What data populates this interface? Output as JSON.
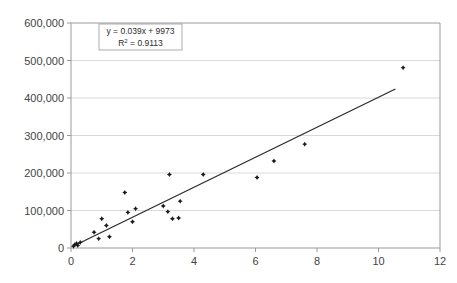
{
  "chart_data": {
    "type": "scatter",
    "title": "",
    "xlabel": "",
    "ylabel": "",
    "xlim": [
      0,
      12
    ],
    "ylim": [
      0,
      600000
    ],
    "grid": true,
    "legend": "none",
    "x_ticks": [
      "0",
      "2",
      "4",
      "6",
      "8",
      "10",
      "12"
    ],
    "x_tick_values": [
      0,
      2,
      4,
      6,
      8,
      10,
      12
    ],
    "y_ticks": [
      "0",
      "100,000",
      "200,000",
      "300,000",
      "400,000",
      "500,000",
      "600,000"
    ],
    "y_tick_values": [
      0,
      100000,
      200000,
      300000,
      400000,
      500000,
      600000
    ],
    "points": [
      {
        "x": 0.08,
        "y": 5000
      },
      {
        "x": 0.12,
        "y": 9000
      },
      {
        "x": 0.18,
        "y": 12000
      },
      {
        "x": 0.22,
        "y": 7000
      },
      {
        "x": 0.3,
        "y": 15000
      },
      {
        "x": 0.75,
        "y": 42000
      },
      {
        "x": 0.9,
        "y": 25000
      },
      {
        "x": 1.0,
        "y": 78000
      },
      {
        "x": 1.15,
        "y": 60000
      },
      {
        "x": 1.25,
        "y": 30000
      },
      {
        "x": 1.75,
        "y": 148000
      },
      {
        "x": 1.85,
        "y": 95000
      },
      {
        "x": 2.0,
        "y": 70000
      },
      {
        "x": 2.1,
        "y": 105000
      },
      {
        "x": 3.0,
        "y": 112000
      },
      {
        "x": 3.15,
        "y": 97000
      },
      {
        "x": 3.2,
        "y": 196000
      },
      {
        "x": 3.3,
        "y": 78000
      },
      {
        "x": 3.5,
        "y": 80000
      },
      {
        "x": 3.55,
        "y": 125000
      },
      {
        "x": 4.3,
        "y": 196000
      },
      {
        "x": 6.05,
        "y": 188000
      },
      {
        "x": 6.6,
        "y": 232000
      },
      {
        "x": 7.6,
        "y": 277000
      },
      {
        "x": 10.8,
        "y": 481000
      }
    ],
    "trendline": {
      "equation": "y = 0.039x + 9973",
      "r_squared_label": "R",
      "r_squared_sup": "2",
      "r_squared_value": "= 0.9113",
      "x_start": 0.05,
      "y_start": 4000,
      "x_end": 10.55,
      "y_end": 424000
    },
    "annotation_box": {
      "line1": "y = 0.039x + 9973",
      "line2_prefix": "R",
      "line2_sup": "2",
      "line2_suffix": " = 0.9113"
    },
    "colors": {
      "point": "#1a1a1a",
      "trendline": "#2b2b2b",
      "gridline": "#c8c8c8",
      "axis": "#9a9a9a",
      "text": "#444444",
      "background": "#ffffff"
    }
  }
}
